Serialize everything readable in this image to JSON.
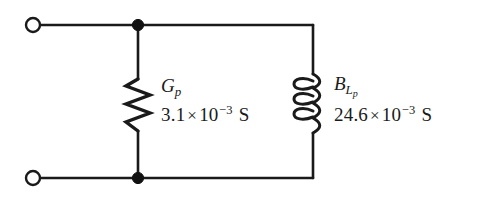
{
  "figure": {
    "type": "circuit-diagram",
    "background_color": "#ffffff",
    "line_color": "#1a1a1a",
    "width": 493,
    "height": 204
  },
  "terminals": [
    {
      "name": "top-left-terminal",
      "style": "open-circle",
      "cx": 33,
      "cy": 25,
      "r": 7
    },
    {
      "name": "bottom-left-terminal",
      "style": "open-circle",
      "cx": 33,
      "cy": 178,
      "r": 7
    }
  ],
  "junctions": [
    {
      "name": "top-junction-node",
      "style": "filled-dot",
      "cx": 138,
      "cy": 25,
      "r": 5.5
    },
    {
      "name": "bottom-junction-node",
      "style": "filled-dot",
      "cx": 138,
      "cy": 178,
      "r": 5.5
    }
  ],
  "components": [
    {
      "id": "conductance",
      "kind": "resistor-zigzag",
      "branch": "left",
      "symbol_base": "G",
      "symbol_sub": "p",
      "value_mantissa": "3.1",
      "value_times": "×",
      "value_base": "10",
      "value_exponent": "−3",
      "value_unit": "S",
      "value_full": "3.1 × 10−3 S"
    },
    {
      "id": "inductive-susceptance",
      "kind": "inductor-coil",
      "branch": "right",
      "coil_loops": 3,
      "symbol_base": "B",
      "symbol_sub": "L",
      "symbol_sub_sub": "p",
      "value_mantissa": "24.6",
      "value_times": "×",
      "value_base": "10",
      "value_exponent": "−3",
      "value_unit": "S",
      "value_full": "24.6 × 10−3 S"
    }
  ]
}
